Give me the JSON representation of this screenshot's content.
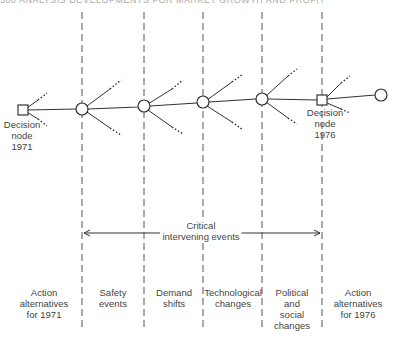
{
  "header": {
    "page_text": "500     ANALYSIS DEVELOPMENTS FOR MARKET GROWTH AND PROFIT"
  },
  "nodes": {
    "decision_1971": {
      "line1": "Decision",
      "line2": "node",
      "line3": "1971"
    },
    "decision_1976": {
      "line1": "Decision",
      "line2": "node",
      "line3": "1976"
    }
  },
  "span": {
    "line1": "Critical",
    "line2": "intervening events"
  },
  "columns": [
    {
      "lines": [
        "Action",
        "alternatives",
        "for  1971"
      ]
    },
    {
      "lines": [
        "Safety",
        "events"
      ]
    },
    {
      "lines": [
        "Demand",
        "shifts"
      ]
    },
    {
      "lines": [
        "Technological",
        "changes"
      ]
    },
    {
      "lines": [
        "Political",
        "and",
        "social",
        "changes"
      ]
    },
    {
      "lines": [
        "Action",
        "alternatives",
        "for  1976"
      ]
    }
  ]
}
